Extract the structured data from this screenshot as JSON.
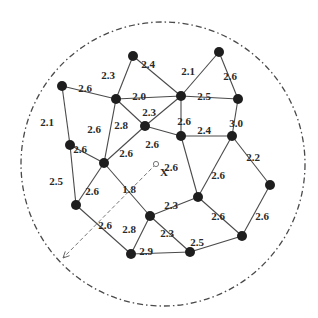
{
  "diagram": {
    "type": "weighted-network-in-circular-region",
    "boundary": {
      "cx": 163,
      "cy": 164,
      "r": 142,
      "style": "dash-dot"
    },
    "marker": {
      "label": "X",
      "x": 156,
      "y": 164,
      "arrow_to": {
        "x": 63,
        "y": 258
      }
    },
    "nodes": [
      {
        "id": "n1",
        "x": 133,
        "y": 56
      },
      {
        "id": "n2",
        "x": 219,
        "y": 52
      },
      {
        "id": "n3",
        "x": 62,
        "y": 86
      },
      {
        "id": "n4",
        "x": 116,
        "y": 99
      },
      {
        "id": "n5",
        "x": 181,
        "y": 96
      },
      {
        "id": "n6",
        "x": 238,
        "y": 99
      },
      {
        "id": "n7",
        "x": 145,
        "y": 126
      },
      {
        "id": "n8",
        "x": 181,
        "y": 136
      },
      {
        "id": "n9",
        "x": 232,
        "y": 136
      },
      {
        "id": "n10",
        "x": 70,
        "y": 145
      },
      {
        "id": "n11",
        "x": 104,
        "y": 163
      },
      {
        "id": "n12",
        "x": 270,
        "y": 185
      },
      {
        "id": "n13",
        "x": 198,
        "y": 197
      },
      {
        "id": "n14",
        "x": 76,
        "y": 205
      },
      {
        "id": "n15",
        "x": 150,
        "y": 216
      },
      {
        "id": "n16",
        "x": 242,
        "y": 236
      },
      {
        "id": "n17",
        "x": 131,
        "y": 254
      },
      {
        "id": "n18",
        "x": 190,
        "y": 252
      }
    ],
    "edges": [
      {
        "from": "n1",
        "to": "n4",
        "weight": "2.3",
        "lx": 108,
        "ly": 76
      },
      {
        "from": "n1",
        "to": "n5",
        "weight": "2.4",
        "lx": 148,
        "ly": 65
      },
      {
        "from": "n2",
        "to": "n5",
        "weight": "2.1",
        "lx": 188,
        "ly": 72
      },
      {
        "from": "n2",
        "to": "n6",
        "weight": "2.6",
        "lx": 230,
        "ly": 77
      },
      {
        "from": "n3",
        "to": "n4",
        "weight": "2.6",
        "lx": 85,
        "ly": 89
      },
      {
        "from": "n4",
        "to": "n5",
        "weight": "2.0",
        "lx": 139,
        "ly": 97
      },
      {
        "from": "n5",
        "to": "n6",
        "weight": "2.5",
        "lx": 204,
        "ly": 97
      },
      {
        "from": "n3",
        "to": "n10",
        "weight": "2.1",
        "lx": 47,
        "ly": 123
      },
      {
        "from": "n4",
        "to": "n7",
        "weight": "2.8",
        "lx": 121,
        "ly": 126
      },
      {
        "from": "n5",
        "to": "n7",
        "weight": "2.3",
        "lx": 149,
        "ly": 113
      },
      {
        "from": "n4",
        "to": "n11",
        "weight": "2.6",
        "lx": 94,
        "ly": 130
      },
      {
        "from": "n5",
        "to": "n8",
        "weight": "2.6",
        "lx": 184,
        "ly": 122
      },
      {
        "from": "n6",
        "to": "n9",
        "weight": "3.0",
        "lx": 236,
        "ly": 124
      },
      {
        "from": "n7",
        "to": "n8",
        "weight": "2.6",
        "lx": 152,
        "ly": 145
      },
      {
        "from": "n8",
        "to": "n9",
        "weight": "2.4",
        "lx": 204,
        "ly": 131
      },
      {
        "from": "n10",
        "to": "n11",
        "weight": "2.6",
        "lx": 80,
        "ly": 150
      },
      {
        "from": "n7",
        "to": "n11",
        "weight": "2.6",
        "lx": 126,
        "ly": 154
      },
      {
        "from": "n10",
        "to": "n14",
        "weight": "2.5",
        "lx": 56,
        "ly": 182
      },
      {
        "from": "n11",
        "to": "n14",
        "weight": "2.6",
        "lx": 92,
        "ly": 192
      },
      {
        "from": "n11",
        "to": "n15",
        "weight": "1.8",
        "lx": 129,
        "ly": 190
      },
      {
        "from": "n8",
        "to": "n13",
        "weight": "2.6",
        "lx": 171,
        "ly": 168
      },
      {
        "from": "n9",
        "to": "n13",
        "weight": "2.6",
        "lx": 218,
        "ly": 176
      },
      {
        "from": "n9",
        "to": "n12",
        "weight": "2.2",
        "lx": 253,
        "ly": 158
      },
      {
        "from": "n14",
        "to": "n17",
        "weight": "2.6",
        "lx": 105,
        "ly": 226
      },
      {
        "from": "n15",
        "to": "n13",
        "weight": "2.3",
        "lx": 171,
        "ly": 206
      },
      {
        "from": "n15",
        "to": "n17",
        "weight": "2.8",
        "lx": 129,
        "ly": 230
      },
      {
        "from": "n15",
        "to": "n18",
        "weight": "2.3",
        "lx": 167,
        "ly": 234
      },
      {
        "from": "n13",
        "to": "n16",
        "weight": "2.6",
        "lx": 218,
        "ly": 217
      },
      {
        "from": "n12",
        "to": "n16",
        "weight": "2.6",
        "lx": 262,
        "ly": 217
      },
      {
        "from": "n17",
        "to": "n18",
        "weight": "2.9",
        "lx": 146,
        "ly": 252
      },
      {
        "from": "n18",
        "to": "n16",
        "weight": "2.5",
        "lx": 197,
        "ly": 243
      }
    ]
  }
}
